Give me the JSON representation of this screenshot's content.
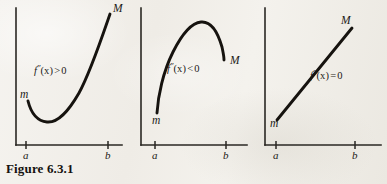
{
  "figure": {
    "caption": "Figure 6.3.1",
    "background_color": "#f3f1ec",
    "ink_color": "#16130f"
  },
  "panels": [
    {
      "id": "convex",
      "shape": "convex-curve",
      "description": "Curve decreasing then increasing, minimum at left interior, endpoints m low-left and M high-right",
      "expression": {
        "f": "f",
        "prime": "″",
        "arg": "(x)",
        "relation": ">",
        "value": "0",
        "full": "f″(x) > 0"
      },
      "left_endpoint_label": "m",
      "right_endpoint_label": "M",
      "x_tick_labels": [
        "a",
        "b"
      ]
    },
    {
      "id": "concave",
      "shape": "concave-curve",
      "description": "Curve rising to an interior maximum then falling, endpoints m low-left and M mid-right",
      "expression": {
        "f": "f",
        "prime": "″",
        "arg": "(x)",
        "relation": "<",
        "value": "0",
        "full": "f″(x) < 0"
      },
      "left_endpoint_label": "m",
      "right_endpoint_label": "M",
      "x_tick_labels": [
        "a",
        "b"
      ]
    },
    {
      "id": "linear",
      "shape": "straight-line",
      "description": "Straight increasing line from m at lower-left to M at upper-right",
      "expression": {
        "f": "f",
        "prime": "″",
        "arg": "(x)",
        "relation": "=",
        "value": "0",
        "full": "f″(x) = 0"
      },
      "left_endpoint_label": "m",
      "right_endpoint_label": "M",
      "x_tick_labels": [
        "a",
        "b"
      ]
    }
  ]
}
